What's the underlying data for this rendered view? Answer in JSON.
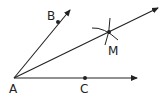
{
  "diagram": {
    "type": "angle-bisector-construction",
    "points": {
      "A": {
        "label": "A",
        "x": 14,
        "y": 78
      },
      "B": {
        "label": "B",
        "x": 58,
        "y": 22
      },
      "C": {
        "label": "C",
        "x": 85,
        "y": 78
      },
      "M": {
        "label": "M",
        "x": 109,
        "y": 32
      }
    },
    "rays": [
      "AB",
      "AM",
      "AC"
    ],
    "colors": {
      "stroke": "#222222",
      "background": "#ffffff"
    }
  }
}
